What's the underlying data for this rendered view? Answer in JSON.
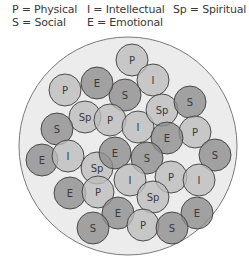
{
  "legend": {
    "items": [
      {
        "text": "P = Physical",
        "x": 12,
        "y": 9
      },
      {
        "text": "I = Intellectual",
        "x": 87,
        "y": 9
      },
      {
        "text": "Sp = Spiritual",
        "x": 173,
        "y": 9
      },
      {
        "text": "S = Social",
        "x": 12,
        "y": 22
      },
      {
        "text": "E = Emotional",
        "x": 87,
        "y": 22
      }
    ]
  },
  "colors": {
    "background": "#ffffff",
    "outer_fill": "#ececec",
    "outer_stroke": "#7a7a7a",
    "dark_fill": "#8c8c8c",
    "light_fill": "#bcbcbc",
    "circle_stroke": "#3c3c3c",
    "label": "#3a3a3a"
  },
  "outer_circle": {
    "cx": 128,
    "cy": 146,
    "r": 109
  },
  "circle_radius": 16,
  "circles": [
    {
      "label": "P",
      "cx": 132,
      "cy": 60,
      "tone": "light"
    },
    {
      "label": "I",
      "cx": 153,
      "cy": 80,
      "tone": "light"
    },
    {
      "label": "S",
      "cx": 125,
      "cy": 95,
      "tone": "dark"
    },
    {
      "label": "E",
      "cx": 97,
      "cy": 83,
      "tone": "dark"
    },
    {
      "label": "P",
      "cx": 65,
      "cy": 90,
      "tone": "light"
    },
    {
      "label": "Sp",
      "cx": 85,
      "cy": 117,
      "tone": "light"
    },
    {
      "label": "P",
      "cx": 110,
      "cy": 120,
      "tone": "light"
    },
    {
      "label": "I",
      "cx": 138,
      "cy": 127,
      "tone": "light"
    },
    {
      "label": "Sp",
      "cx": 162,
      "cy": 110,
      "tone": "light"
    },
    {
      "label": "S",
      "cx": 190,
      "cy": 102,
      "tone": "dark"
    },
    {
      "label": "P",
      "cx": 195,
      "cy": 132,
      "tone": "light"
    },
    {
      "label": "E",
      "cx": 167,
      "cy": 138,
      "tone": "dark"
    },
    {
      "label": "S",
      "cx": 215,
      "cy": 155,
      "tone": "dark"
    },
    {
      "label": "S",
      "cx": 57,
      "cy": 129,
      "tone": "dark"
    },
    {
      "label": "E",
      "cx": 42,
      "cy": 160,
      "tone": "dark"
    },
    {
      "label": "I",
      "cx": 68,
      "cy": 156,
      "tone": "light"
    },
    {
      "label": "Sp",
      "cx": 97,
      "cy": 168,
      "tone": "light"
    },
    {
      "label": "E",
      "cx": 115,
      "cy": 153,
      "tone": "dark"
    },
    {
      "label": "S",
      "cx": 147,
      "cy": 158,
      "tone": "dark"
    },
    {
      "label": "I",
      "cx": 130,
      "cy": 180,
      "tone": "light"
    },
    {
      "label": "P",
      "cx": 171,
      "cy": 177,
      "tone": "light"
    },
    {
      "label": "I",
      "cx": 199,
      "cy": 180,
      "tone": "light"
    },
    {
      "label": "E",
      "cx": 70,
      "cy": 193,
      "tone": "dark"
    },
    {
      "label": "P",
      "cx": 98,
      "cy": 192,
      "tone": "light"
    },
    {
      "label": "Sp",
      "cx": 153,
      "cy": 197,
      "tone": "light"
    },
    {
      "label": "E",
      "cx": 197,
      "cy": 213,
      "tone": "dark"
    },
    {
      "label": "E",
      "cx": 118,
      "cy": 213,
      "tone": "dark"
    },
    {
      "label": "S",
      "cx": 93,
      "cy": 228,
      "tone": "dark"
    },
    {
      "label": "P",
      "cx": 143,
      "cy": 225,
      "tone": "light"
    },
    {
      "label": "S",
      "cx": 172,
      "cy": 228,
      "tone": "dark"
    }
  ]
}
